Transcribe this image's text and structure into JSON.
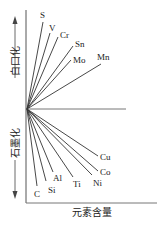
{
  "chart_data": {
    "type": "diagram",
    "title": "",
    "xlabel": "元素含量",
    "ylabel_up": "白口化",
    "ylabel_down": "石墨化",
    "origin": [
      27,
      109
    ],
    "axis": {
      "x_start": 26,
      "x_end": 157,
      "y_top": 10,
      "y_bottom": 203,
      "midline_end": 126
    },
    "series_up": [
      {
        "name": "S",
        "end": [
          43,
          22
        ],
        "label_pos": [
          40,
          18
        ]
      },
      {
        "name": "V",
        "end": [
          50,
          33
        ],
        "label_pos": [
          49,
          31
        ]
      },
      {
        "name": "Cr",
        "end": [
          58,
          37
        ],
        "label_pos": [
          60,
          38
        ]
      },
      {
        "name": "Sn",
        "end": [
          73,
          46
        ],
        "label_pos": [
          75,
          47
        ]
      },
      {
        "name": "Mo",
        "end": [
          71,
          60
        ],
        "label_pos": [
          73,
          63
        ]
      },
      {
        "name": "Mn",
        "end": [
          101,
          64
        ],
        "label_pos": [
          97,
          60
        ]
      }
    ],
    "series_down": [
      {
        "name": "C",
        "end": [
          37,
          186
        ],
        "label_pos": [
          34,
          197
        ]
      },
      {
        "name": "Si",
        "end": [
          46,
          181
        ],
        "label_pos": [
          48,
          193
        ]
      },
      {
        "name": "Al",
        "end": [
          53,
          172
        ],
        "label_pos": [
          53,
          181
        ]
      },
      {
        "name": "Ti",
        "end": [
          73,
          177
        ],
        "label_pos": [
          73,
          187
        ]
      },
      {
        "name": "Ni",
        "end": [
          92,
          175
        ],
        "label_pos": [
          93,
          186
        ]
      },
      {
        "name": "Co",
        "end": [
          98,
          171
        ],
        "label_pos": [
          100,
          175
        ]
      },
      {
        "name": "Cu",
        "end": [
          98,
          156
        ],
        "label_pos": [
          100,
          160
        ]
      }
    ]
  },
  "labels": {
    "x_axis": "元素含量",
    "up": "白口化",
    "down": "石墨化"
  },
  "colors": {
    "line": "#333333",
    "axis": "#555555",
    "text": "#222222"
  }
}
